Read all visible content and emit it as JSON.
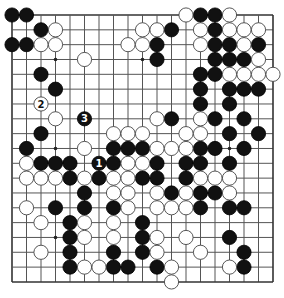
{
  "board": {
    "size": 19,
    "origin_x": 12,
    "origin_y": 15,
    "step_x": 14.5,
    "step_y": 14.83,
    "stone_radius": 7.1,
    "colors": {
      "black": "#111111",
      "white": "#ffffff",
      "line": "#555555",
      "background": "#ffffff"
    },
    "star_points": [
      [
        3,
        3
      ],
      [
        9,
        3
      ],
      [
        15,
        3
      ],
      [
        3,
        9
      ],
      [
        9,
        9
      ],
      [
        15,
        9
      ],
      [
        3,
        15
      ],
      [
        9,
        15
      ],
      [
        15,
        15
      ]
    ]
  },
  "stones": {
    "black": [
      [
        0,
        0
      ],
      [
        1,
        0
      ],
      [
        13,
        0
      ],
      [
        14,
        0
      ],
      [
        2,
        1
      ],
      [
        11,
        1
      ],
      [
        14,
        1
      ],
      [
        0,
        2
      ],
      [
        1,
        2
      ],
      [
        10,
        2
      ],
      [
        14,
        2
      ],
      [
        15,
        2
      ],
      [
        17,
        2
      ],
      [
        10,
        3
      ],
      [
        14,
        3
      ],
      [
        15,
        3
      ],
      [
        16,
        3
      ],
      [
        2,
        4
      ],
      [
        13,
        4
      ],
      [
        14,
        4
      ],
      [
        3,
        5
      ],
      [
        13,
        5
      ],
      [
        15,
        5
      ],
      [
        16,
        5
      ],
      [
        17,
        5
      ],
      [
        13,
        6
      ],
      [
        15,
        6
      ],
      [
        11,
        7
      ],
      [
        14,
        7
      ],
      [
        16,
        7
      ],
      [
        2,
        8
      ],
      [
        15,
        8
      ],
      [
        17,
        8
      ],
      [
        1,
        9
      ],
      [
        7,
        9
      ],
      [
        8,
        9
      ],
      [
        9,
        9
      ],
      [
        13,
        9
      ],
      [
        14,
        9
      ],
      [
        16,
        9
      ],
      [
        2,
        10
      ],
      [
        3,
        10
      ],
      [
        4,
        10
      ],
      [
        7,
        10
      ],
      [
        10,
        10
      ],
      [
        12,
        10
      ],
      [
        13,
        10
      ],
      [
        15,
        10
      ],
      [
        4,
        11
      ],
      [
        6,
        11
      ],
      [
        9,
        11
      ],
      [
        10,
        11
      ],
      [
        12,
        11
      ],
      [
        5,
        12
      ],
      [
        11,
        12
      ],
      [
        13,
        12
      ],
      [
        14,
        12
      ],
      [
        3,
        13
      ],
      [
        5,
        13
      ],
      [
        7,
        13
      ],
      [
        13,
        13
      ],
      [
        15,
        13
      ],
      [
        16,
        13
      ],
      [
        4,
        14
      ],
      [
        9,
        14
      ],
      [
        4,
        15
      ],
      [
        9,
        15
      ],
      [
        15,
        15
      ],
      [
        4,
        16
      ],
      [
        7,
        16
      ],
      [
        9,
        16
      ],
      [
        16,
        16
      ],
      [
        4,
        17
      ],
      [
        7,
        17
      ],
      [
        8,
        17
      ],
      [
        10,
        17
      ],
      [
        16,
        17
      ]
    ],
    "white": [
      [
        12,
        0
      ],
      [
        15,
        0
      ],
      [
        3,
        1
      ],
      [
        9,
        1
      ],
      [
        10,
        1
      ],
      [
        13,
        1
      ],
      [
        15,
        1
      ],
      [
        16,
        1
      ],
      [
        17,
        1
      ],
      [
        2,
        2
      ],
      [
        3,
        2
      ],
      [
        8,
        2
      ],
      [
        9,
        2
      ],
      [
        13,
        2
      ],
      [
        16,
        2
      ],
      [
        5,
        3
      ],
      [
        17,
        3
      ],
      [
        15,
        4
      ],
      [
        16,
        4
      ],
      [
        17,
        4
      ],
      [
        18,
        4
      ],
      [
        3,
        7
      ],
      [
        10,
        7
      ],
      [
        13,
        7
      ],
      [
        7,
        8
      ],
      [
        8,
        8
      ],
      [
        9,
        8
      ],
      [
        12,
        8
      ],
      [
        13,
        8
      ],
      [
        5,
        9
      ],
      [
        10,
        9
      ],
      [
        11,
        9
      ],
      [
        12,
        9
      ],
      [
        1,
        10
      ],
      [
        8,
        10
      ],
      [
        9,
        10
      ],
      [
        1,
        11
      ],
      [
        2,
        11
      ],
      [
        3,
        11
      ],
      [
        5,
        11
      ],
      [
        7,
        11
      ],
      [
        8,
        11
      ],
      [
        13,
        11
      ],
      [
        14,
        11
      ],
      [
        15,
        11
      ],
      [
        7,
        12
      ],
      [
        8,
        12
      ],
      [
        10,
        12
      ],
      [
        12,
        12
      ],
      [
        15,
        12
      ],
      [
        1,
        13
      ],
      [
        8,
        13
      ],
      [
        10,
        13
      ],
      [
        11,
        13
      ],
      [
        12,
        13
      ],
      [
        2,
        14
      ],
      [
        5,
        14
      ],
      [
        7,
        14
      ],
      [
        5,
        15
      ],
      [
        7,
        15
      ],
      [
        10,
        15
      ],
      [
        12,
        15
      ],
      [
        2,
        16
      ],
      [
        10,
        16
      ],
      [
        13,
        16
      ],
      [
        5,
        17
      ],
      [
        6,
        17
      ],
      [
        11,
        17
      ],
      [
        15,
        17
      ],
      [
        11,
        18
      ]
    ],
    "numbered": [
      {
        "number": "1",
        "color": "black",
        "pos": [
          6,
          10
        ]
      },
      {
        "number": "2",
        "color": "white",
        "pos": [
          2,
          6
        ]
      },
      {
        "number": "3",
        "color": "black",
        "pos": [
          5,
          7
        ]
      }
    ]
  }
}
